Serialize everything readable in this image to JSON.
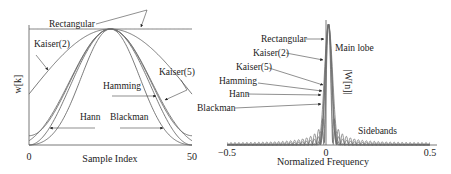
{
  "chart_data": [
    {
      "type": "line",
      "title": "",
      "xlabel": "Sample Index",
      "ylabel": "w[k]",
      "xlim": [
        0,
        50
      ],
      "ylim": [
        0,
        1
      ],
      "x_tick_labels": [
        "0",
        "50"
      ],
      "grid": false,
      "series": [
        {
          "name": "Rectangular",
          "function": "rectangular",
          "N": 50
        },
        {
          "name": "Kaiser(2)",
          "function": "kaiser",
          "beta": 2,
          "N": 50
        },
        {
          "name": "Kaiser(5)",
          "function": "kaiser",
          "beta": 5,
          "N": 50
        },
        {
          "name": "Hamming",
          "function": "hamming",
          "N": 50
        },
        {
          "name": "Hann",
          "function": "hann",
          "N": 50
        },
        {
          "name": "Blackman",
          "function": "blackman",
          "N": 50
        }
      ],
      "annotations": [
        "Rectangular",
        "Kaiser(2)",
        "Kaiser(5)",
        "Hamming",
        "Hann",
        "Blackman"
      ]
    },
    {
      "type": "line",
      "title": "",
      "xlabel": "Normalized Frequency",
      "ylabel": "|W[n]|",
      "xlim": [
        -0.5,
        0.5
      ],
      "ylim": [
        0,
        1
      ],
      "x_tick_labels": [
        "−0.5",
        "0",
        "0.5"
      ],
      "grid": false,
      "series": [
        {
          "name": "Rectangular"
        },
        {
          "name": "Kaiser(2)"
        },
        {
          "name": "Kaiser(5)"
        },
        {
          "name": "Hamming"
        },
        {
          "name": "Hann"
        },
        {
          "name": "Blackman"
        }
      ],
      "annotations": [
        "Rectangular",
        "Kaiser(2)",
        "Kaiser(5)",
        "Hamming",
        "Hann",
        "Blackman",
        "Main lobe",
        "Sidebands"
      ]
    }
  ]
}
